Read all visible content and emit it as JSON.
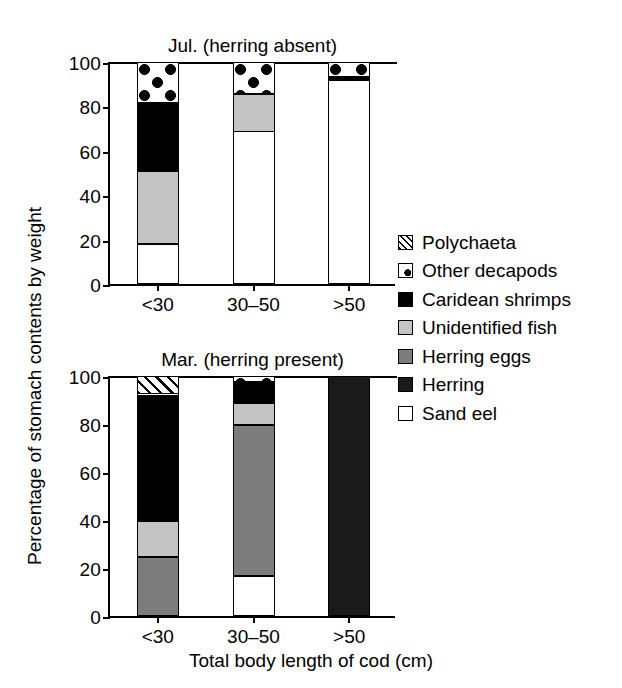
{
  "figure": {
    "ylabel": "Percentage of stomach contents by weight",
    "xlabel": "Total body length of cod (cm)"
  },
  "legend": {
    "items": [
      {
        "label": "Polychaeta",
        "key": "polychaeta",
        "swatch": "hatch-swatch",
        "color": "#ffffff"
      },
      {
        "label": "Other decapods",
        "key": "other_decapods",
        "swatch": "dot-swatch",
        "color": "#ffffff"
      },
      {
        "label": "Caridean shrimps",
        "key": "caridean_shrimps",
        "swatch": "brick-swatch",
        "color": "#ffffff"
      },
      {
        "label": "Unidentified fish",
        "key": "unidentified_fish",
        "swatch": "lightgray-swatch",
        "color": "#c4c4c4"
      },
      {
        "label": "Herring eggs",
        "key": "herring_eggs",
        "swatch": "midgray-swatch",
        "color": "#7d7d7d"
      },
      {
        "label": "Herring",
        "key": "herring",
        "swatch": "black-swatch",
        "color": "#1a1a1a"
      },
      {
        "label": "Sand eel",
        "key": "sand_eel",
        "swatch": "white-swatch",
        "color": "#ffffff"
      }
    ]
  },
  "chart_data": [
    {
      "type": "bar",
      "stacked": true,
      "title": "Jul. (herring absent)",
      "xlabel": "",
      "ylabel": "Percentage of stomach contents by weight",
      "categories": [
        "<30",
        "30–50",
        ">50"
      ],
      "yticks": [
        0,
        20,
        40,
        60,
        80,
        100
      ],
      "ylim": [
        0,
        100
      ],
      "grid": false,
      "legend_position": "right",
      "series": [
        {
          "name": "Sand eel",
          "values": [
            18.5,
            69.0,
            92.0
          ]
        },
        {
          "name": "Herring",
          "values": [
            0,
            0,
            0
          ]
        },
        {
          "name": "Herring eggs",
          "values": [
            0,
            0,
            0
          ]
        },
        {
          "name": "Unidentified fish",
          "values": [
            32.5,
            17.0,
            0
          ]
        },
        {
          "name": "Caridean shrimps",
          "values": [
            31.0,
            0,
            1.5
          ]
        },
        {
          "name": "Other decapods",
          "values": [
            18.0,
            14.0,
            6.5
          ]
        },
        {
          "name": "Polychaeta",
          "values": [
            0,
            0,
            0
          ]
        }
      ]
    },
    {
      "type": "bar",
      "stacked": true,
      "title": "Mar. (herring present)",
      "xlabel": "Total body length of cod (cm)",
      "ylabel": "Percentage of stomach contents by weight",
      "categories": [
        "<30",
        "30–50",
        ">50"
      ],
      "yticks": [
        0,
        20,
        40,
        60,
        80,
        100
      ],
      "ylim": [
        0,
        100
      ],
      "grid": false,
      "legend_position": "right",
      "series": [
        {
          "name": "Sand eel",
          "values": [
            0,
            17.0,
            0
          ]
        },
        {
          "name": "Herring",
          "values": [
            0,
            0,
            100.0
          ]
        },
        {
          "name": "Herring eggs",
          "values": [
            25.0,
            63.0,
            0
          ]
        },
        {
          "name": "Unidentified fish",
          "values": [
            15.0,
            9.0,
            0
          ]
        },
        {
          "name": "Caridean shrimps",
          "values": [
            52.0,
            9.0,
            0
          ]
        },
        {
          "name": "Other decapods",
          "values": [
            1.0,
            2.0,
            0
          ]
        },
        {
          "name": "Polychaeta",
          "values": [
            7.0,
            0,
            0
          ]
        }
      ]
    }
  ]
}
